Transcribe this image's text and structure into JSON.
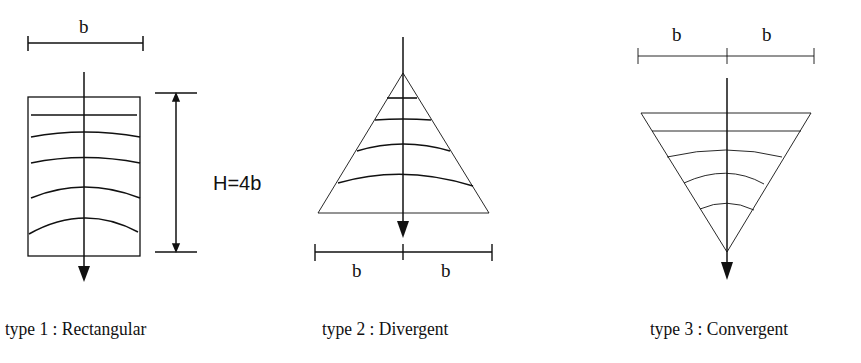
{
  "diagrams": [
    {
      "id": "type1",
      "caption": "type 1 : Rectangular",
      "width_label": "b",
      "height_label": "H=4b"
    },
    {
      "id": "type2",
      "caption": "type 2 : Divergent",
      "base_labels": [
        "b",
        "b"
      ]
    },
    {
      "id": "type3",
      "caption": "type 3 : Convergent",
      "top_labels": [
        "b",
        "b"
      ]
    }
  ]
}
